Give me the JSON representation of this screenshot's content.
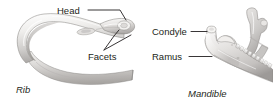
{
  "figure": {
    "background_color": "#ffffff",
    "ink_color": "#231f20",
    "bone_light": "#f4f3f1",
    "bone_mid": "#d7d5d3",
    "bone_dark": "#a9a7a6",
    "bone_shadow": "#84817f",
    "panels": [
      {
        "specimen_label": "Rib",
        "callouts": [
          {
            "label": "Head"
          },
          {
            "label": "Facets"
          }
        ]
      },
      {
        "specimen_label": "Mandible",
        "callouts": [
          {
            "label": "Condyle"
          },
          {
            "label": "Ramus"
          }
        ]
      }
    ]
  },
  "rib": {
    "specimen_label": "Rib",
    "head_label": "Head",
    "facets_label": "Facets"
  },
  "mandible": {
    "specimen_label": "Mandible",
    "condyle_label": "Condyle",
    "ramus_label": "Ramus"
  },
  "icons": {
    "rib_bone": "rib-bone-illustration",
    "mandible_bone": "mandible-bone-illustration",
    "leader_line": "leader-line"
  }
}
